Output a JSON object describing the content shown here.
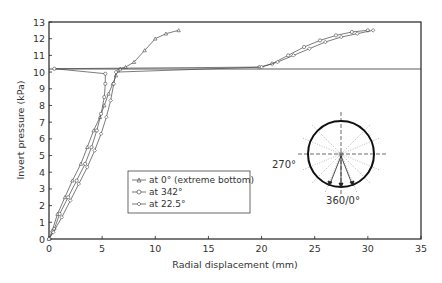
{
  "chart_data": {
    "type": "line",
    "title": "",
    "xlabel": "Radial displacement (mm)",
    "ylabel": "Invert pressure (kPa)",
    "xlim": [
      0,
      35
    ],
    "ylim": [
      0,
      13
    ],
    "xticks": [
      0,
      5,
      10,
      15,
      20,
      25,
      30,
      35
    ],
    "yticks": [
      0,
      1,
      2,
      3,
      4,
      5,
      6,
      7,
      8,
      9,
      10,
      11,
      12,
      13
    ],
    "grid": false,
    "legend_position": "center-left inside plot",
    "series": [
      {
        "name": "at 0° (extreme bottom)",
        "marker": "triangle",
        "x": [
          0,
          0.3,
          0.8,
          1.5,
          2.2,
          3.0,
          3.6,
          4.2,
          4.8,
          5.2,
          5.6,
          6.0,
          6.3,
          6.5,
          6.7,
          7.2,
          8.0,
          9.0,
          10.0,
          11.0,
          12.2
        ],
        "y": [
          0,
          0.5,
          1.5,
          2.5,
          3.5,
          4.5,
          5.5,
          6.5,
          7.3,
          8.0,
          8.7,
          9.3,
          9.8,
          10.1,
          10.2,
          10.3,
          10.6,
          11.3,
          12.0,
          12.3,
          12.5
        ]
      },
      {
        "name": "at 342°",
        "marker": "circle",
        "x": [
          0,
          0.5,
          1.0,
          1.8,
          2.6,
          3.4,
          4.0,
          4.5,
          4.9,
          5.2,
          5.3,
          5.3,
          0.5,
          19.8,
          21.0,
          22.5,
          24.0,
          25.5,
          27.0,
          28.5,
          30.0
        ],
        "y": [
          0,
          0.6,
          1.5,
          2.5,
          3.5,
          4.5,
          5.5,
          6.5,
          7.5,
          8.5,
          9.3,
          9.9,
          10.2,
          10.3,
          10.5,
          11.0,
          11.5,
          11.9,
          12.2,
          12.4,
          12.5
        ]
      },
      {
        "name": "at 22.5°",
        "marker": "diamond",
        "x": [
          0,
          0.4,
          1.2,
          2.0,
          2.8,
          3.6,
          4.3,
          4.9,
          5.4,
          5.8,
          6.1,
          6.3,
          20.0,
          21.5,
          23.0,
          24.5,
          26.0,
          27.5,
          29.0,
          30.5
        ],
        "y": [
          0,
          0.4,
          1.3,
          2.3,
          3.3,
          4.3,
          5.3,
          6.3,
          7.3,
          8.3,
          9.3,
          10.0,
          10.3,
          10.6,
          11.0,
          11.4,
          11.8,
          12.1,
          12.3,
          12.5
        ]
      }
    ],
    "annotations": {
      "inset_diagram": "circular pipe cross-section with dashed crosshair and radial dotted lines, three arrows at bottom",
      "angle_labels": [
        "270°",
        "360/0°"
      ]
    }
  },
  "axes": {
    "xlabel": "Radial displacement (mm)",
    "ylabel": "Invert pressure (kPa)",
    "xtick_labels": [
      "0",
      "5",
      "10",
      "15",
      "20",
      "25",
      "30",
      "35"
    ],
    "ytick_labels": [
      "0",
      "1",
      "2",
      "3",
      "4",
      "5",
      "6",
      "7",
      "8",
      "9",
      "10",
      "11",
      "12",
      "13"
    ]
  },
  "legend": {
    "items": [
      {
        "label": "at 0° (extreme bottom)",
        "marker": "triangle"
      },
      {
        "label": "at 342°",
        "marker": "circle"
      },
      {
        "label": "at 22.5°",
        "marker": "diamond"
      }
    ]
  },
  "inset": {
    "label_left": "270°",
    "label_bottom": "360/0°"
  }
}
